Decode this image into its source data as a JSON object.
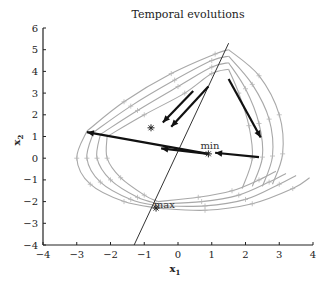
{
  "chart_data": {
    "type": "line",
    "title": "Temporal evolutions",
    "xlabel": "x",
    "xlabel_sub": "1",
    "ylabel": "x",
    "ylabel_sub": "2",
    "xlim": [
      -4,
      4
    ],
    "ylim": [
      -4,
      6
    ],
    "xticks": [
      -4,
      -3,
      -2,
      -1,
      0,
      1,
      2,
      3,
      4
    ],
    "yticks": [
      -4,
      -3,
      -2,
      -1,
      0,
      1,
      2,
      3,
      4,
      5,
      6
    ],
    "grid": false,
    "legend": null,
    "annotations": [
      {
        "text": "min",
        "x": 0.9,
        "y": 0.2
      },
      {
        "text": "max",
        "x": -0.6,
        "y": -2.1
      }
    ],
    "reference_line": {
      "description": "principal direction line",
      "points": [
        [
          -1.3,
          -4.0
        ],
        [
          1.5,
          5.3
        ]
      ]
    },
    "markers": [
      {
        "symbol": "star",
        "x": 0.9,
        "y": 0.2
      },
      {
        "symbol": "star",
        "x": -0.65,
        "y": -2.3
      },
      {
        "symbol": "star",
        "x": -0.8,
        "y": 1.4
      }
    ],
    "arrows": [
      {
        "from": [
          0.9,
          0.2
        ],
        "to": [
          -2.7,
          1.2
        ]
      },
      {
        "from": [
          0.9,
          0.2
        ],
        "to": [
          -0.5,
          0.45
        ],
        "note": "arrowhead toward center from left segment"
      },
      {
        "from": [
          2.4,
          0.05
        ],
        "to": [
          1.1,
          0.25
        ]
      },
      {
        "from": [
          1.5,
          3.65
        ],
        "to": [
          2.45,
          0.95
        ]
      },
      {
        "from": [
          0.45,
          3.1
        ],
        "to": [
          -0.45,
          1.65
        ]
      },
      {
        "from": [
          0.9,
          3.3
        ],
        "to": [
          -0.2,
          1.45
        ]
      }
    ],
    "series": [
      {
        "name": "trajectory-upper-1",
        "points": [
          [
            -2.7,
            1.25
          ],
          [
            -1.6,
            2.6
          ],
          [
            -0.2,
            3.9
          ],
          [
            1.1,
            4.8
          ],
          [
            1.5,
            5.0
          ]
        ]
      },
      {
        "name": "trajectory-upper-2",
        "points": [
          [
            -2.5,
            1.2
          ],
          [
            -1.4,
            2.4
          ],
          [
            -0.1,
            3.6
          ],
          [
            1.0,
            4.5
          ],
          [
            1.5,
            4.7
          ]
        ]
      },
      {
        "name": "trajectory-upper-3",
        "points": [
          [
            -2.3,
            1.1
          ],
          [
            -1.2,
            2.2
          ],
          [
            0.0,
            3.3
          ],
          [
            1.0,
            4.2
          ],
          [
            1.5,
            4.4
          ]
        ]
      },
      {
        "name": "trajectory-upper-4",
        "points": [
          [
            -2.1,
            1.0
          ],
          [
            -1.0,
            2.0
          ],
          [
            0.2,
            3.0
          ],
          [
            1.0,
            3.9
          ],
          [
            1.5,
            4.1
          ]
        ]
      },
      {
        "name": "trajectory-right-1",
        "points": [
          [
            1.5,
            5.0
          ],
          [
            2.4,
            3.8
          ],
          [
            3.0,
            2.0
          ],
          [
            3.1,
            0.2
          ],
          [
            2.8,
            -1.2
          ]
        ]
      },
      {
        "name": "trajectory-right-2",
        "points": [
          [
            1.5,
            4.7
          ],
          [
            2.2,
            3.4
          ],
          [
            2.7,
            1.8
          ],
          [
            2.8,
            0.1
          ],
          [
            2.5,
            -1.3
          ]
        ]
      },
      {
        "name": "trajectory-right-3",
        "points": [
          [
            1.5,
            4.4
          ],
          [
            2.0,
            3.2
          ],
          [
            2.4,
            1.6
          ],
          [
            2.5,
            0.05
          ],
          [
            2.2,
            -1.3
          ]
        ]
      },
      {
        "name": "trajectory-right-4",
        "points": [
          [
            1.5,
            4.1
          ],
          [
            1.8,
            3.0
          ],
          [
            2.1,
            1.5
          ],
          [
            2.2,
            0.0
          ],
          [
            1.9,
            -1.4
          ]
        ]
      },
      {
        "name": "trajectory-left-1",
        "points": [
          [
            -2.7,
            1.25
          ],
          [
            -3.0,
            0.0
          ],
          [
            -2.6,
            -1.2
          ],
          [
            -1.6,
            -2.0
          ],
          [
            -0.6,
            -2.3
          ]
        ]
      },
      {
        "name": "trajectory-left-2",
        "points": [
          [
            -2.5,
            1.2
          ],
          [
            -2.7,
            0.0
          ],
          [
            -2.3,
            -1.1
          ],
          [
            -1.4,
            -1.9
          ],
          [
            -0.6,
            -2.2
          ]
        ]
      },
      {
        "name": "trajectory-left-3",
        "points": [
          [
            -2.3,
            1.1
          ],
          [
            -2.4,
            0.0
          ],
          [
            -2.0,
            -1.0
          ],
          [
            -1.2,
            -1.8
          ],
          [
            -0.6,
            -2.1
          ]
        ]
      },
      {
        "name": "trajectory-left-4",
        "points": [
          [
            -2.1,
            1.0
          ],
          [
            -2.1,
            0.0
          ],
          [
            -1.7,
            -0.9
          ],
          [
            -1.0,
            -1.7
          ],
          [
            -0.6,
            -2.0
          ]
        ]
      },
      {
        "name": "trajectory-lower-1",
        "points": [
          [
            -0.6,
            -2.3
          ],
          [
            0.8,
            -2.4
          ],
          [
            2.2,
            -2.1
          ],
          [
            3.4,
            -1.4
          ],
          [
            3.9,
            -0.9
          ]
        ]
      },
      {
        "name": "trajectory-lower-2",
        "points": [
          [
            -0.6,
            -2.2
          ],
          [
            0.8,
            -2.2
          ],
          [
            2.0,
            -1.9
          ],
          [
            3.0,
            -1.2
          ],
          [
            3.5,
            -0.8
          ]
        ]
      },
      {
        "name": "trajectory-lower-3",
        "points": [
          [
            -0.6,
            -2.1
          ],
          [
            0.7,
            -2.0
          ],
          [
            1.8,
            -1.7
          ],
          [
            2.7,
            -1.1
          ],
          [
            3.2,
            -0.7
          ]
        ]
      },
      {
        "name": "trajectory-lower-4",
        "points": [
          [
            -0.6,
            -2.0
          ],
          [
            0.6,
            -1.8
          ],
          [
            1.6,
            -1.5
          ],
          [
            2.4,
            -1.0
          ],
          [
            2.9,
            -0.6
          ]
        ]
      }
    ]
  }
}
